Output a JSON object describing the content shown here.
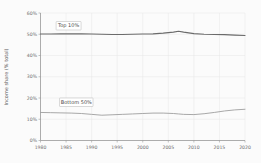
{
  "chart_data": {
    "type": "line",
    "title": "",
    "subtitle": "",
    "xlabel": "",
    "ylabel": "Income share (% total)",
    "xlim": [
      1980,
      2020
    ],
    "ylim": [
      0,
      60
    ],
    "grid": true,
    "legend_position": "inline-annotation",
    "x_ticks": [
      "1980",
      "1985",
      "1990",
      "1995",
      "2000",
      "2005",
      "2010",
      "2015",
      "2020"
    ],
    "x_tick_values": [
      1980,
      1985,
      1990,
      1995,
      2000,
      2005,
      2010,
      2015,
      2020
    ],
    "y_ticks": [
      "0%",
      "10%",
      "20%",
      "30%",
      "40%",
      "50%",
      "60%"
    ],
    "y_tick_values": [
      0,
      10,
      20,
      30,
      40,
      50,
      60
    ],
    "x": [
      1980,
      1982,
      1984,
      1986,
      1988,
      1990,
      1992,
      1994,
      1996,
      1998,
      2000,
      2002,
      2004,
      2006,
      2007,
      2008,
      2010,
      2012,
      2014,
      2016,
      2018,
      2020
    ],
    "series": [
      {
        "name": "Top 10%",
        "color": "#6b6b6b",
        "values": [
          50.1,
          50.1,
          50.2,
          50.2,
          50.2,
          50.1,
          50.0,
          49.9,
          49.9,
          50.0,
          50.1,
          50.2,
          50.5,
          51.0,
          51.4,
          51.0,
          50.3,
          50.0,
          49.9,
          49.8,
          49.6,
          49.4
        ]
      },
      {
        "name": "Bottom 50%",
        "color": "#9e9e9e",
        "values": [
          13.2,
          13.1,
          13.0,
          12.9,
          12.7,
          12.3,
          11.9,
          12.1,
          12.3,
          12.5,
          12.7,
          12.9,
          12.9,
          12.7,
          12.5,
          12.3,
          12.2,
          12.6,
          13.2,
          13.9,
          14.4,
          14.7
        ]
      }
    ],
    "annotations": [
      {
        "name": "Top 10%",
        "label": "Top 10%",
        "x": 1985.5,
        "y": 54.0,
        "series": "Top 10%"
      },
      {
        "name": "Bottom 50%",
        "label": "Bottom 50%",
        "x": 1987.0,
        "y": 18.0,
        "series": "Bottom 50%"
      }
    ]
  }
}
